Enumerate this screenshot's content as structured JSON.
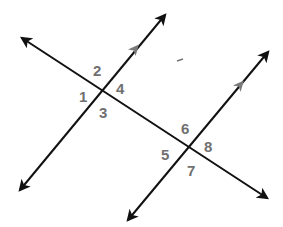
{
  "diagram": {
    "colors": {
      "line": "#111111",
      "label": "#707070",
      "parallel_marker": "#7a7a7a"
    },
    "lines": [
      {
        "id": "transversal",
        "x1": 22,
        "y1": 38,
        "x2": 267,
        "y2": 198
      },
      {
        "id": "parallel-line-1",
        "x1": 20,
        "y1": 190,
        "x2": 165,
        "y2": 15
      },
      {
        "id": "parallel-line-2",
        "x1": 128,
        "y1": 220,
        "x2": 268,
        "y2": 52
      }
    ],
    "intersections": [
      {
        "id": "intersection-1",
        "x": 101,
        "y": 90
      },
      {
        "id": "intersection-2",
        "x": 189,
        "y": 148
      }
    ],
    "angles": [
      {
        "label": "1",
        "x": 79,
        "y": 102
      },
      {
        "label": "2",
        "x": 93,
        "y": 76
      },
      {
        "label": "3",
        "x": 99,
        "y": 118
      },
      {
        "label": "4",
        "x": 116,
        "y": 94
      },
      {
        "label": "5",
        "x": 161,
        "y": 160
      },
      {
        "label": "6",
        "x": 181,
        "y": 134
      },
      {
        "label": "7",
        "x": 187,
        "y": 176
      },
      {
        "label": "8",
        "x": 204,
        "y": 152
      }
    ]
  }
}
